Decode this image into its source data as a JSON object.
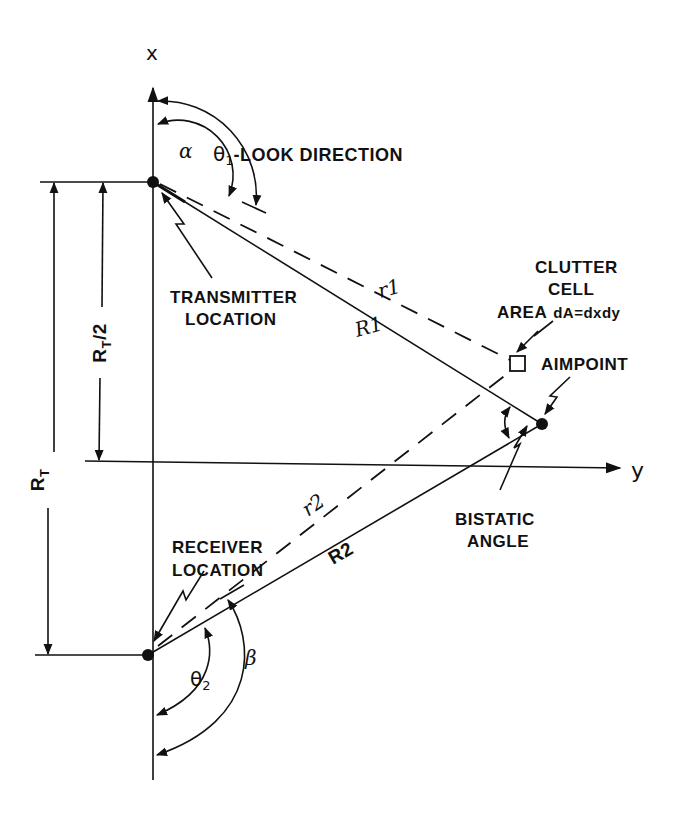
{
  "diagram": {
    "axes": {
      "x_label": "x",
      "y_label": "y"
    },
    "points": {
      "transmitter": {
        "label_line1": "TRANSMITTER",
        "label_line2": "LOCATION"
      },
      "receiver": {
        "label_line1": "RECEIVER",
        "label_line2": "LOCATION"
      },
      "aimpoint": {
        "label": "AIMPOINT"
      },
      "clutter_cell": {
        "label_line1": "CLUTTER",
        "label_line2": "CELL",
        "label_line3_a": "AREA",
        "label_line3_b": "dA=dxdy"
      }
    },
    "distances": {
      "r1": "r1",
      "R1": "R1",
      "r2": "r2",
      "R2": "R2",
      "RT": "R",
      "RT_sub": "T",
      "RT_half_main": "R",
      "RT_half_sub": "T",
      "RT_half_suffix": "/2"
    },
    "angles": {
      "alpha": "α",
      "theta1": "θ",
      "theta1_sub": "1",
      "theta1_desc": "-LOOK DIRECTION",
      "theta2": "θ",
      "theta2_sub": "2",
      "beta": "β",
      "bistatic_line1": "BISTATIC",
      "bistatic_line2": "ANGLE"
    },
    "colors": {
      "ink": "#111111",
      "background": "#ffffff"
    }
  }
}
